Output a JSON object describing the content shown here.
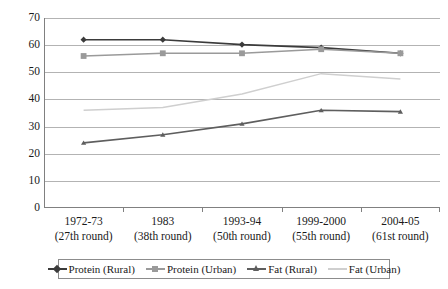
{
  "chart_data": {
    "type": "line",
    "title": "",
    "xlabel": "",
    "ylabel": "",
    "ylim": [
      0,
      70
    ],
    "yticks": [
      0,
      10,
      20,
      30,
      40,
      50,
      60,
      70
    ],
    "grid": true,
    "legend_position": "bottom",
    "categories": [
      "1972-73\n(27th round)",
      "1983\n(38th round)",
      "1993-94\n(50th round)",
      "1999-2000\n(55th round)",
      "2004-05\n(61st round)"
    ],
    "category_lines": [
      {
        "line1": "1972-73",
        "line2": "(27th round)"
      },
      {
        "line1": "1983",
        "line2": "(38th round)"
      },
      {
        "line1": "1993-94",
        "line2": "(50th round)"
      },
      {
        "line1": "1999-2000",
        "line2": "(55th round)"
      },
      {
        "line1": "2004-05",
        "line2": "(61st round)"
      }
    ],
    "series": [
      {
        "name": "Protein (Rural)",
        "values": [
          62,
          62,
          60.2,
          59.1,
          57
        ],
        "color": "#3b3b3b",
        "marker": "diamond"
      },
      {
        "name": "Protein (Urban)",
        "values": [
          56,
          57,
          57,
          58.5,
          57
        ],
        "color": "#9a9a9a",
        "marker": "square"
      },
      {
        "name": "Fat (Rural)",
        "values": [
          24,
          27,
          31,
          36,
          35.5
        ],
        "color": "#5e5e5e",
        "marker": "triangle"
      },
      {
        "name": "Fat (Urban)",
        "values": [
          36,
          37,
          42,
          49.5,
          47.5
        ],
        "color": "#cfcfcf",
        "marker": "none"
      }
    ]
  },
  "axis": {
    "ytick_labels": [
      "70",
      "60",
      "50",
      "40",
      "30",
      "20",
      "10",
      "0"
    ]
  },
  "legend": {
    "items": [
      {
        "label": "Protein (Rural)",
        "color": "#3b3b3b",
        "marker": "diamond"
      },
      {
        "label": "Protein (Urban)",
        "color": "#9a9a9a",
        "marker": "square"
      },
      {
        "label": "Fat (Rural)",
        "color": "#5e5e5e",
        "marker": "triangle"
      },
      {
        "label": "Fat (Urban)",
        "color": "#cfcfcf",
        "marker": "none"
      }
    ]
  }
}
